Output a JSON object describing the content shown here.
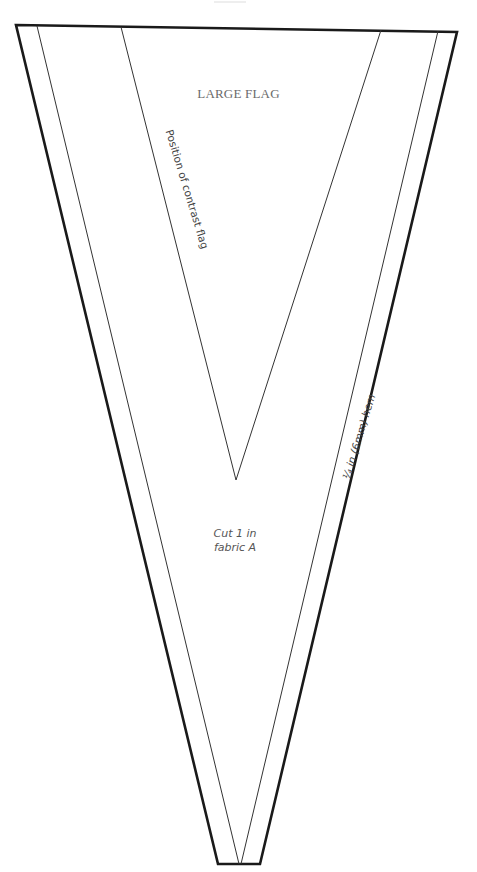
{
  "pattern": {
    "title": "LARGE FLAG",
    "contrast_note": "Position of contrast flag",
    "hem_note": "¼ in (6mm) hem",
    "cut_instruction_line1": "Cut 1 in",
    "cut_instruction_line2": "fabric A"
  },
  "colors": {
    "outline": "#1a1a1a",
    "inner_line": "#333333",
    "text": "#555555",
    "background": "#ffffff"
  }
}
